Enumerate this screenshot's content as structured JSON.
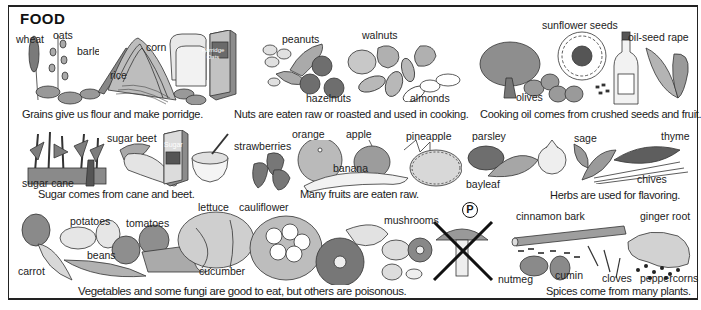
{
  "title": "FOOD",
  "panels": {
    "grains": {
      "caption": "Grains give us flour and make porridge.",
      "labels": [
        "wheat",
        "oats",
        "barley",
        "rice",
        "corn"
      ],
      "box_text": [
        "Porridge",
        "Oats"
      ]
    },
    "nuts": {
      "caption": "Nuts are eaten raw or roasted and used in cooking.",
      "labels": [
        "peanuts",
        "walnuts",
        "hazelnuts",
        "almonds"
      ]
    },
    "oils": {
      "caption": "Cooking oil comes from crushed seeds and fruit.",
      "labels": [
        "sunflower seeds",
        "oil-seed rape",
        "olives"
      ]
    },
    "sugar": {
      "caption": "Sugar comes from cane and beet.",
      "labels": [
        "sugar beet",
        "sugar cane"
      ],
      "box_text": "Sugar"
    },
    "fruits": {
      "caption": "Many fruits are eaten raw.",
      "labels": [
        "strawberries",
        "orange",
        "apple",
        "banana",
        "pineapple"
      ]
    },
    "herbs": {
      "caption": "Herbs are used for flavoring.",
      "labels": [
        "parsley",
        "sage",
        "thyme",
        "bayleaf",
        "chives"
      ]
    },
    "vegetables": {
      "caption": "Vegetables and some fungi are good to eat, but others are poisonous.",
      "labels": [
        "potatoes",
        "tomatoes",
        "lettuce",
        "cauliflower",
        "mushrooms",
        "beans",
        "carrot",
        "cucumber"
      ],
      "poison_symbol": "P"
    },
    "spices": {
      "caption": "Spices come from many plants.",
      "labels": [
        "cinnamon bark",
        "ginger root",
        "nutmeg",
        "cumin",
        "cloves",
        "peppercorns"
      ]
    }
  },
  "colors": {
    "ink": "#1a1a1a",
    "shade": "#8a8a8a",
    "light": "#d0d0d0",
    "paper": "#ffffff"
  }
}
